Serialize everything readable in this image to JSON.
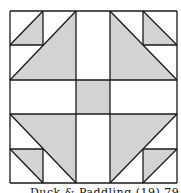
{
  "diagram": {
    "type": "quilt-block",
    "grid": "5x5",
    "colors": {
      "shade": "#d3d3d3",
      "line": "#1a1a1a",
      "background": "#ffffff"
    },
    "block": {
      "x0": 10,
      "y0": 11,
      "x1": 177,
      "y1": 183
    },
    "xs": [
      10,
      43,
      76,
      110,
      143,
      177
    ],
    "ys": [
      11,
      45,
      80,
      114,
      149,
      183
    ],
    "shaded_polygons": [
      {
        "name": "top-left-small-triangle",
        "points": "10,45 43,11 43,45"
      },
      {
        "name": "top-right-small-triangle",
        "points": "143,11 177,45 143,45"
      },
      {
        "name": "bottom-left-small-triangle",
        "points": "10,149 43,149 43,183"
      },
      {
        "name": "bottom-right-small-triangle",
        "points": "143,149 177,149 143,183"
      },
      {
        "name": "top-left-large-triangle",
        "points": "10,80 76,11 76,80"
      },
      {
        "name": "top-right-large-triangle",
        "points": "110,11 177,80 110,80"
      },
      {
        "name": "bottom-left-large-triangle",
        "points": "10,114 76,114 76,183"
      },
      {
        "name": "bottom-right-large-triangle",
        "points": "110,114 177,114 110,183"
      },
      {
        "name": "center-square",
        "points": "76,80 110,80 110,114 76,114"
      }
    ]
  },
  "caption": "Duck & Paddling (19) 79"
}
